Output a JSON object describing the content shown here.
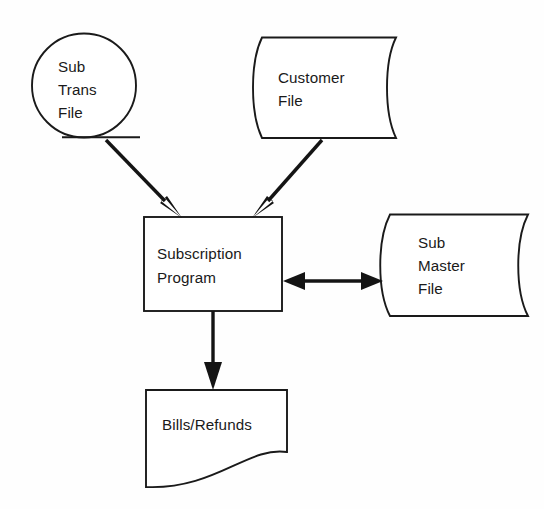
{
  "diagram": {
    "background_color": "#fefefe",
    "line_color": "#1a1a1a",
    "arrow_color": "#141414",
    "text_color": "#1a1a1a",
    "nodes": [
      {
        "id": "sub-trans-file",
        "shape": "magnetic-drum-circle",
        "lines": [
          "Sub",
          "Trans",
          "File"
        ],
        "line1": "Sub",
        "line2": "Trans",
        "line3": "File"
      },
      {
        "id": "customer-file",
        "shape": "magnetic-tape",
        "lines": [
          "Customer",
          "File"
        ],
        "line1": "Customer",
        "line2": "File"
      },
      {
        "id": "subscription-program",
        "shape": "process-rectangle",
        "lines": [
          "Subscription",
          "Program"
        ],
        "line1": "Subscription",
        "line2": "Program"
      },
      {
        "id": "sub-master-file",
        "shape": "magnetic-tape",
        "lines": [
          "Sub",
          "Master",
          "File"
        ],
        "line1": "Sub",
        "line2": "Master",
        "line3": "File"
      },
      {
        "id": "bills-refunds",
        "shape": "document",
        "lines": [
          "Bills/Refunds"
        ],
        "line1": "Bills/Refunds"
      }
    ],
    "connectors": [
      {
        "id": "sub-trans-to-program",
        "from": "sub-trans-file",
        "to": "subscription-program",
        "direction": "one-way",
        "label": ""
      },
      {
        "id": "customer-to-program",
        "from": "customer-file",
        "to": "subscription-program",
        "direction": "one-way",
        "label": ""
      },
      {
        "id": "program-to-sub-master",
        "from": "subscription-program",
        "to": "sub-master-file",
        "direction": "two-way",
        "label": ""
      },
      {
        "id": "program-to-bills",
        "from": "subscription-program",
        "to": "bills-refunds",
        "direction": "one-way",
        "label": ""
      }
    ]
  }
}
